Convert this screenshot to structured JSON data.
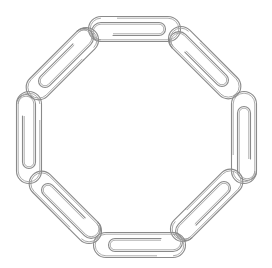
{
  "image": {
    "subject": "Ring of linked paperclips",
    "shape": "octagon",
    "clip_count": 8,
    "colors": {
      "background": "#ffffff",
      "outline": "#8a8a8a",
      "inner_outline": "#a4a4a4"
    }
  },
  "clips": [
    {
      "name": "top",
      "cx": 135,
      "cy": 29,
      "angle": 0
    },
    {
      "name": "top-right",
      "cx": 205,
      "cy": 63,
      "angle": 45
    },
    {
      "name": "right",
      "cx": 244,
      "cy": 137,
      "angle": -90
    },
    {
      "name": "bottom-right",
      "cx": 207,
      "cy": 205,
      "angle": -45
    },
    {
      "name": "bottom",
      "cx": 139,
      "cy": 245,
      "angle": 180
    },
    {
      "name": "bottom-left",
      "cx": 65,
      "cy": 207,
      "angle": 225
    },
    {
      "name": "left",
      "cx": 29,
      "cy": 138,
      "angle": 90
    },
    {
      "name": "top-left",
      "cx": 62,
      "cy": 64,
      "angle": 135
    }
  ]
}
